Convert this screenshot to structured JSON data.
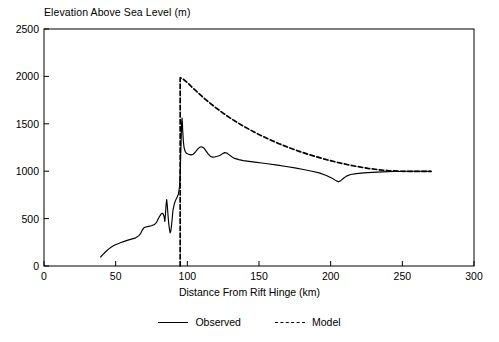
{
  "chart_data": {
    "type": "line",
    "title": "",
    "ylabel": "Elevation Above Sea Level (m)",
    "xlabel": "Distance From Rift Hinge (km)",
    "xlim": [
      0,
      300
    ],
    "ylim": [
      0,
      2500
    ],
    "xticks": [
      0,
      50,
      100,
      150,
      200,
      250,
      300
    ],
    "yticks": [
      0,
      500,
      1000,
      1500,
      2000,
      2500
    ],
    "grid": false,
    "legend_position": "below",
    "series": [
      {
        "name": "Observed",
        "style": "solid",
        "color": "#000000",
        "points": [
          [
            39.5,
            95
          ],
          [
            41,
            120
          ],
          [
            43,
            150
          ],
          [
            45,
            178
          ],
          [
            47,
            200
          ],
          [
            49,
            218
          ],
          [
            52,
            238
          ],
          [
            55,
            255
          ],
          [
            58,
            270
          ],
          [
            61,
            283
          ],
          [
            64,
            297
          ],
          [
            66,
            318
          ],
          [
            67.5,
            345
          ],
          [
            68.5,
            378
          ],
          [
            69.5,
            400
          ],
          [
            71,
            412
          ],
          [
            73,
            418
          ],
          [
            75,
            424
          ],
          [
            77,
            437
          ],
          [
            78.5,
            460
          ],
          [
            79.5,
            492
          ],
          [
            80.5,
            520
          ],
          [
            81.5,
            545
          ],
          [
            82.5,
            556
          ],
          [
            83.2,
            548
          ],
          [
            83.8,
            520
          ],
          [
            84.3,
            470
          ],
          [
            84.8,
            560
          ],
          [
            85.2,
            650
          ],
          [
            85.6,
            700
          ],
          [
            86,
            640
          ],
          [
            86.5,
            540
          ],
          [
            87,
            450
          ],
          [
            87.5,
            390
          ],
          [
            88,
            350
          ],
          [
            88.5,
            370
          ],
          [
            89,
            430
          ],
          [
            89.5,
            510
          ],
          [
            90,
            590
          ],
          [
            91,
            660
          ],
          [
            92,
            700
          ],
          [
            93,
            730
          ],
          [
            93.8,
            760
          ],
          [
            94.4,
            820
          ],
          [
            94.8,
            900
          ],
          [
            95.1,
            1020
          ],
          [
            95.4,
            1180
          ],
          [
            95.7,
            1330
          ],
          [
            95.9,
            1450
          ],
          [
            96.1,
            1530
          ],
          [
            96.3,
            1560
          ],
          [
            96.5,
            1520
          ],
          [
            96.8,
            1420
          ],
          [
            97.2,
            1320
          ],
          [
            97.7,
            1250
          ],
          [
            98.3,
            1215
          ],
          [
            99,
            1195
          ],
          [
            100,
            1185
          ],
          [
            101,
            1178
          ],
          [
            102.5,
            1172
          ],
          [
            104,
            1178
          ],
          [
            105.5,
            1200
          ],
          [
            107,
            1230
          ],
          [
            108.5,
            1252
          ],
          [
            110,
            1258
          ],
          [
            111.5,
            1245
          ],
          [
            113,
            1215
          ],
          [
            114.5,
            1182
          ],
          [
            116,
            1158
          ],
          [
            117.5,
            1148
          ],
          [
            119,
            1150
          ],
          [
            121,
            1158
          ],
          [
            123,
            1168
          ],
          [
            124.5,
            1185
          ],
          [
            126,
            1196
          ],
          [
            127.5,
            1192
          ],
          [
            129,
            1175
          ],
          [
            131,
            1152
          ],
          [
            133,
            1135
          ],
          [
            136,
            1122
          ],
          [
            139,
            1112
          ],
          [
            143,
            1103
          ],
          [
            147,
            1095
          ],
          [
            152,
            1086
          ],
          [
            157,
            1076
          ],
          [
            163,
            1064
          ],
          [
            169,
            1050
          ],
          [
            175,
            1035
          ],
          [
            181,
            1018
          ],
          [
            187,
            1000
          ],
          [
            192,
            982
          ],
          [
            197,
            955
          ],
          [
            201,
            925
          ],
          [
            204,
            898
          ],
          [
            205.5,
            888
          ],
          [
            207,
            900
          ],
          [
            209,
            925
          ],
          [
            211,
            948
          ],
          [
            214,
            965
          ],
          [
            218,
            975
          ],
          [
            223,
            982
          ],
          [
            229,
            988
          ],
          [
            236,
            993
          ],
          [
            244,
            997
          ],
          [
            252,
            999
          ],
          [
            260,
            1000
          ],
          [
            266,
            1000
          ],
          [
            270,
            998
          ]
        ]
      },
      {
        "name": "Model",
        "style": "dashed",
        "color": "#000000",
        "points": [
          [
            95,
            0
          ],
          [
            95,
            500
          ],
          [
            95,
            1000
          ],
          [
            95,
            1500
          ],
          [
            95,
            1985
          ],
          [
            96.5,
            1978
          ],
          [
            99,
            1948
          ],
          [
            102,
            1905
          ],
          [
            105,
            1862
          ],
          [
            108,
            1820
          ],
          [
            112,
            1766
          ],
          [
            116,
            1716
          ],
          [
            120,
            1668
          ],
          [
            125,
            1612
          ],
          [
            130,
            1560
          ],
          [
            135,
            1512
          ],
          [
            140,
            1468
          ],
          [
            146,
            1418
          ],
          [
            152,
            1372
          ],
          [
            158,
            1330
          ],
          [
            164,
            1290
          ],
          [
            170,
            1254
          ],
          [
            177,
            1215
          ],
          [
            184,
            1180
          ],
          [
            191,
            1148
          ],
          [
            198,
            1118
          ],
          [
            205,
            1092
          ],
          [
            212,
            1068
          ],
          [
            219,
            1048
          ],
          [
            226,
            1030
          ],
          [
            233,
            1016
          ],
          [
            240,
            1006
          ],
          [
            247,
            1000
          ],
          [
            254,
            998
          ],
          [
            261,
            998
          ],
          [
            268,
            998
          ],
          [
            270,
            998
          ]
        ]
      }
    ]
  },
  "legend": {
    "observed_label": "Observed",
    "model_label": "Model"
  },
  "axes": {
    "frame_color": "#000000"
  }
}
